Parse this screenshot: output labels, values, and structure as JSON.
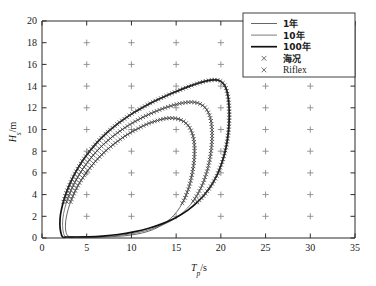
{
  "chart_data": {
    "type": "line",
    "title": "",
    "subtitle": "",
    "xlabel_main": "T",
    "xlabel_sub": "p",
    "xlabel_unit": "/s",
    "ylabel_main": "H",
    "ylabel_sub": "s",
    "ylabel_unit": "/m",
    "xlim": [
      0,
      35
    ],
    "ylim": [
      0,
      20
    ],
    "xticks": [
      0,
      5,
      10,
      15,
      20,
      25,
      30,
      35
    ],
    "yticks": [
      0,
      2,
      4,
      6,
      8,
      10,
      12,
      14,
      16,
      18,
      20
    ],
    "grid": false,
    "grid_marker_symbol": "+",
    "grid_marker_x": [
      5,
      10,
      15,
      20,
      25,
      30
    ],
    "grid_marker_y": [
      2,
      4,
      6,
      8,
      10,
      12,
      14,
      16,
      18
    ],
    "legend_position": "top-right",
    "legend": [
      {
        "label": "1年",
        "type": "line",
        "color": "#555555",
        "width": 0.9
      },
      {
        "label": "10年",
        "type": "line",
        "color": "#6b6b6b",
        "width": 0.9
      },
      {
        "label": "100年",
        "type": "line",
        "color": "#111111",
        "width": 1.7
      },
      {
        "label": "海况",
        "type": "marker",
        "symbol": "×",
        "color": "#3a3a3a"
      },
      {
        "label": "Riflex",
        "type": "marker",
        "symbol": "×",
        "color": "#3a3a3a"
      }
    ],
    "series": [
      {
        "name": "1年",
        "color": "#555555",
        "width": 0.9,
        "closed": true,
        "points": [
          [
            2.95,
            0.15
          ],
          [
            2.7,
            0.5
          ],
          [
            2.62,
            1.0
          ],
          [
            2.66,
            1.6
          ],
          [
            2.82,
            2.3
          ],
          [
            3.1,
            3.1
          ],
          [
            3.5,
            3.95
          ],
          [
            4.0,
            4.8
          ],
          [
            4.6,
            5.6
          ],
          [
            5.25,
            6.35
          ],
          [
            5.95,
            7.05
          ],
          [
            6.7,
            7.7
          ],
          [
            7.5,
            8.3
          ],
          [
            8.35,
            8.85
          ],
          [
            9.2,
            9.35
          ],
          [
            10.1,
            9.8
          ],
          [
            11.0,
            10.2
          ],
          [
            11.9,
            10.55
          ],
          [
            12.8,
            10.8
          ],
          [
            13.6,
            10.98
          ],
          [
            14.3,
            11.05
          ],
          [
            14.95,
            11.02
          ],
          [
            15.55,
            10.88
          ],
          [
            16.05,
            10.62
          ],
          [
            16.45,
            10.25
          ],
          [
            16.75,
            9.75
          ],
          [
            16.95,
            9.15
          ],
          [
            17.05,
            8.45
          ],
          [
            17.05,
            7.7
          ],
          [
            16.98,
            6.9
          ],
          [
            16.82,
            6.05
          ],
          [
            16.6,
            5.2
          ],
          [
            16.3,
            4.35
          ],
          [
            15.9,
            3.55
          ],
          [
            15.4,
            2.8
          ],
          [
            14.75,
            2.1
          ],
          [
            13.95,
            1.5
          ],
          [
            13.0,
            1.0
          ],
          [
            11.9,
            0.62
          ],
          [
            10.6,
            0.36
          ],
          [
            9.2,
            0.2
          ],
          [
            7.7,
            0.12
          ],
          [
            6.2,
            0.08
          ],
          [
            4.8,
            0.07
          ],
          [
            3.7,
            0.09
          ],
          [
            2.95,
            0.15
          ]
        ]
      },
      {
        "name": "10年",
        "color": "#6b6b6b",
        "width": 0.9,
        "closed": true,
        "points": [
          [
            2.6,
            0.12
          ],
          [
            2.38,
            0.55
          ],
          [
            2.3,
            1.15
          ],
          [
            2.34,
            1.85
          ],
          [
            2.52,
            2.65
          ],
          [
            2.85,
            3.55
          ],
          [
            3.3,
            4.5
          ],
          [
            3.88,
            5.45
          ],
          [
            4.55,
            6.35
          ],
          [
            5.3,
            7.2
          ],
          [
            6.1,
            7.98
          ],
          [
            6.95,
            8.68
          ],
          [
            7.85,
            9.32
          ],
          [
            8.8,
            9.9
          ],
          [
            9.75,
            10.42
          ],
          [
            10.75,
            10.9
          ],
          [
            11.75,
            11.32
          ],
          [
            12.75,
            11.68
          ],
          [
            13.7,
            11.98
          ],
          [
            14.6,
            12.22
          ],
          [
            15.45,
            12.4
          ],
          [
            16.2,
            12.5
          ],
          [
            16.9,
            12.52
          ],
          [
            17.5,
            12.42
          ],
          [
            18.0,
            12.2
          ],
          [
            18.4,
            11.85
          ],
          [
            18.7,
            11.38
          ],
          [
            18.9,
            10.8
          ],
          [
            19.0,
            10.1
          ],
          [
            19.02,
            9.3
          ],
          [
            18.96,
            8.45
          ],
          [
            18.82,
            7.55
          ],
          [
            18.6,
            6.62
          ],
          [
            18.28,
            5.68
          ],
          [
            17.86,
            4.78
          ],
          [
            17.32,
            3.92
          ],
          [
            16.65,
            3.12
          ],
          [
            15.82,
            2.4
          ],
          [
            14.82,
            1.78
          ],
          [
            13.62,
            1.25
          ],
          [
            12.25,
            0.82
          ],
          [
            10.7,
            0.5
          ],
          [
            9.05,
            0.28
          ],
          [
            7.35,
            0.16
          ],
          [
            5.7,
            0.1
          ],
          [
            4.25,
            0.08
          ],
          [
            3.2,
            0.09
          ],
          [
            2.6,
            0.12
          ]
        ]
      },
      {
        "name": "100年",
        "color": "#111111",
        "width": 1.7,
        "closed": true,
        "points": [
          [
            2.3,
            0.1
          ],
          [
            2.08,
            0.6
          ],
          [
            2.0,
            1.3
          ],
          [
            2.06,
            2.1
          ],
          [
            2.28,
            3.0
          ],
          [
            2.65,
            4.0
          ],
          [
            3.15,
            5.05
          ],
          [
            3.78,
            6.1
          ],
          [
            4.52,
            7.1
          ],
          [
            5.35,
            8.02
          ],
          [
            6.25,
            8.88
          ],
          [
            7.2,
            9.66
          ],
          [
            8.2,
            10.36
          ],
          [
            9.25,
            11.0
          ],
          [
            10.3,
            11.58
          ],
          [
            11.4,
            12.1
          ],
          [
            12.5,
            12.58
          ],
          [
            13.6,
            13.0
          ],
          [
            14.65,
            13.38
          ],
          [
            15.65,
            13.72
          ],
          [
            16.6,
            14.02
          ],
          [
            17.45,
            14.26
          ],
          [
            18.2,
            14.44
          ],
          [
            18.85,
            14.55
          ],
          [
            19.4,
            14.58
          ],
          [
            19.85,
            14.5
          ],
          [
            20.2,
            14.3
          ],
          [
            20.48,
            13.98
          ],
          [
            20.68,
            13.52
          ],
          [
            20.82,
            12.95
          ],
          [
            20.9,
            12.28
          ],
          [
            20.94,
            11.5
          ],
          [
            20.92,
            10.65
          ],
          [
            20.84,
            9.75
          ],
          [
            20.68,
            8.8
          ],
          [
            20.44,
            7.85
          ],
          [
            20.1,
            6.88
          ],
          [
            19.64,
            5.92
          ],
          [
            19.05,
            5.0
          ],
          [
            18.3,
            4.12
          ],
          [
            17.38,
            3.3
          ],
          [
            16.28,
            2.55
          ],
          [
            15.0,
            1.9
          ],
          [
            13.55,
            1.35
          ],
          [
            11.95,
            0.9
          ],
          [
            10.25,
            0.56
          ],
          [
            8.5,
            0.32
          ],
          [
            6.75,
            0.18
          ],
          [
            5.1,
            0.11
          ],
          [
            3.7,
            0.09
          ],
          [
            2.8,
            0.09
          ],
          [
            2.3,
            0.1
          ]
        ]
      }
    ],
    "marker_series": [
      {
        "name": "海况",
        "symbol": "×",
        "color": "#3a3a3a",
        "note": "× markers traced along the 1年 and 10年 contour envelopes"
      },
      {
        "name": "Riflex",
        "symbol": "×",
        "color": "#3a3a3a",
        "note": "× markers traced along the 100年 contour envelope"
      }
    ]
  }
}
